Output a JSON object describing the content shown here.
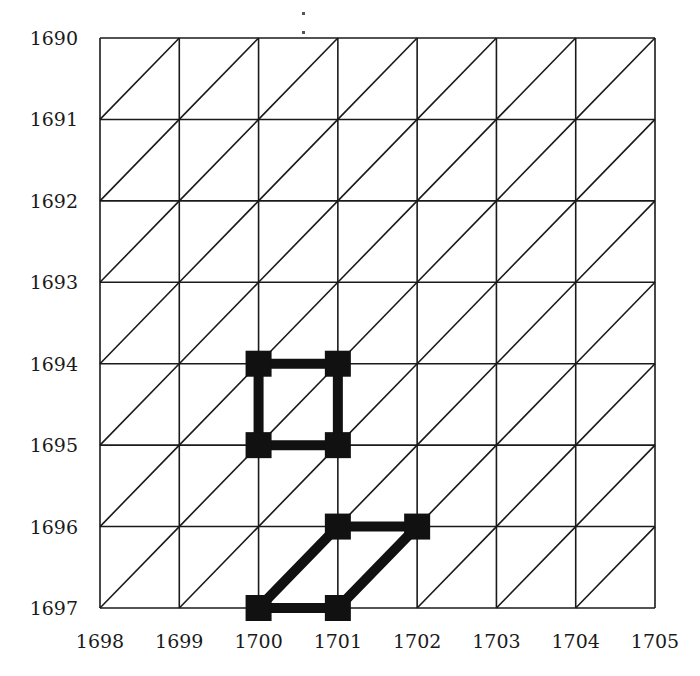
{
  "figure": {
    "type": "triangulated-grid-diagram",
    "x_axis": {
      "ticks": [
        "1698",
        "1699",
        "1700",
        "1701",
        "1702",
        "1703",
        "1704",
        "1705"
      ]
    },
    "y_axis": {
      "ticks": [
        "1690",
        "1691",
        "1692",
        "1693",
        "1694",
        "1695",
        "1696",
        "1697"
      ],
      "direction": "downward"
    },
    "grid": {
      "cols": 7,
      "rows": 7,
      "diagonal": "bottom-left-to-top-right",
      "line_color": "#1a1a1a"
    },
    "highlighted_paths": [
      {
        "name": "square-loop",
        "vertices": [
          [
            1700,
            1694
          ],
          [
            1701,
            1694
          ],
          [
            1701,
            1695
          ],
          [
            1700,
            1695
          ]
        ],
        "closed": true
      },
      {
        "name": "parallelogram-loop",
        "vertices": [
          [
            1701,
            1696
          ],
          [
            1702,
            1696
          ],
          [
            1701,
            1697
          ],
          [
            1700,
            1697
          ]
        ],
        "closed": true
      }
    ],
    "marker": {
      "shape": "square",
      "color": "#111111",
      "size_px": 26
    },
    "path_width_px": 10
  },
  "chart_data": {
    "type": "scatter",
    "title": "",
    "xlabel": "",
    "ylabel": "",
    "x_ticks": [
      1698,
      1699,
      1700,
      1701,
      1702,
      1703,
      1704,
      1705
    ],
    "y_ticks": [
      1690,
      1691,
      1692,
      1693,
      1694,
      1695,
      1696,
      1697
    ],
    "xlim": [
      1698,
      1705
    ],
    "ylim": [
      1697,
      1690
    ],
    "grid": true,
    "series": [
      {
        "name": "loop-1",
        "points": [
          [
            1700,
            1694
          ],
          [
            1701,
            1694
          ],
          [
            1701,
            1695
          ],
          [
            1700,
            1695
          ],
          [
            1700,
            1694
          ]
        ]
      },
      {
        "name": "loop-2",
        "points": [
          [
            1701,
            1696
          ],
          [
            1702,
            1696
          ],
          [
            1701,
            1697
          ],
          [
            1700,
            1697
          ],
          [
            1701,
            1696
          ]
        ]
      }
    ]
  }
}
